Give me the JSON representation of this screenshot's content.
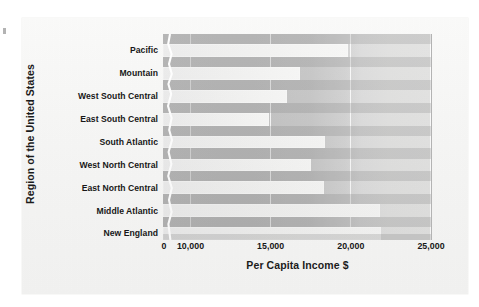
{
  "chart_data": {
    "type": "bar",
    "orientation": "horizontal",
    "title": "",
    "xlabel": "Per Capita Income $",
    "ylabel": "Region of the United States",
    "categories": [
      "Pacific",
      "Mountain",
      "West South Central",
      "East South Central",
      "South Atlantic",
      "West North Central",
      "East North Central",
      "Middle Atlantic",
      "New England"
    ],
    "values": [
      19800,
      16800,
      16000,
      14900,
      18400,
      17500,
      18300,
      21800,
      21900
    ],
    "xticks": [
      0,
      10000,
      15000,
      20000,
      25000
    ],
    "xtick_labels": [
      "0",
      "10,000",
      "15,000",
      "20,000",
      "25,000"
    ],
    "xlim": [
      0,
      25000
    ],
    "axis_break": {
      "present": true,
      "between": [
        0,
        10000
      ],
      "note": "compressed / broken x-axis segment marked by a wavy white line near 5,000"
    },
    "grid": true,
    "grid_axis": "x",
    "legend": null,
    "colors": {
      "bar_fill": "#f1f1f0",
      "plot_background_left": "#c2c2c2",
      "plot_background_right": "#e1e1e0",
      "gridline": "#ffffff",
      "text": "#171717",
      "page_background": "#f6f6f5"
    }
  },
  "axis": {
    "y_title": "Region of the United States",
    "x_title": "Per Capita Income $"
  },
  "ticks": {
    "x": [
      {
        "label": "0",
        "value": 0
      },
      {
        "label": "10,000",
        "value": 10000
      },
      {
        "label": "15,000",
        "value": 15000
      },
      {
        "label": "20,000",
        "value": 20000
      },
      {
        "label": "25,000",
        "value": 25000
      }
    ]
  }
}
